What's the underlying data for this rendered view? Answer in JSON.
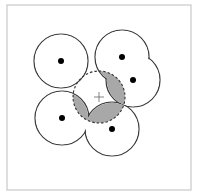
{
  "frame": {
    "x": 7,
    "y": 5,
    "width": 184,
    "height": 185,
    "stroke": "#c8c8c8"
  },
  "colors": {
    "circle_stroke": "#3a3a3a",
    "dot": "#000000",
    "shade": "#a8a8a8",
    "dashed_stroke": "#333333",
    "plus": "#666666"
  },
  "circles": [
    {
      "id": "circle-top-left",
      "cx": 61,
      "cy": 61,
      "r": 27
    },
    {
      "id": "circle-top-right-a",
      "cx": 122,
      "cy": 57,
      "r": 27
    },
    {
      "id": "circle-top-right-b",
      "cx": 133,
      "cy": 80,
      "r": 27
    },
    {
      "id": "circle-bottom-left",
      "cx": 62,
      "cy": 118,
      "r": 27
    },
    {
      "id": "circle-bottom-right",
      "cx": 112,
      "cy": 129,
      "r": 27
    }
  ],
  "dot_radius": 3,
  "dashed_circle": {
    "cx": 99,
    "cy": 97,
    "r": 26
  },
  "plus_marker": {
    "x": 99,
    "y": 97,
    "size": 5
  }
}
